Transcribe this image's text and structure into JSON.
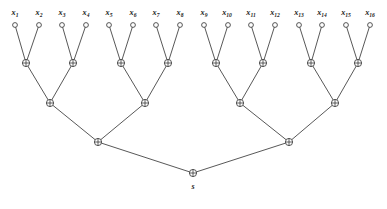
{
  "diagram": {
    "name": "xor-binary-tree",
    "background_color": "#ffffff",
    "line_color": "#3a3a3a",
    "text_color": "#1c1c1c",
    "operator_symbol": "xor-plus-circle",
    "root_label": "s",
    "levels": 5,
    "leaf_count": 16
  },
  "leaves": [
    {
      "id": "x1",
      "base": "x",
      "sub": "1",
      "cx": 15,
      "cy": 25,
      "label_x": 15,
      "label_y": 15
    },
    {
      "id": "x2",
      "base": "x",
      "sub": "2",
      "cx": 39,
      "cy": 25,
      "label_x": 39,
      "label_y": 15
    },
    {
      "id": "x3",
      "base": "x",
      "sub": "3",
      "cx": 62,
      "cy": 25,
      "label_x": 62,
      "label_y": 15
    },
    {
      "id": "x4",
      "base": "x",
      "sub": "4",
      "cx": 86,
      "cy": 25,
      "label_x": 86,
      "label_y": 15
    },
    {
      "id": "x5",
      "base": "x",
      "sub": "5",
      "cx": 109,
      "cy": 25,
      "label_x": 109,
      "label_y": 15
    },
    {
      "id": "x6",
      "base": "x",
      "sub": "6",
      "cx": 133,
      "cy": 25,
      "label_x": 133,
      "label_y": 15
    },
    {
      "id": "x7",
      "base": "x",
      "sub": "7",
      "cx": 156,
      "cy": 25,
      "label_x": 156,
      "label_y": 15
    },
    {
      "id": "x8",
      "base": "x",
      "sub": "8",
      "cx": 180,
      "cy": 25,
      "label_x": 180,
      "label_y": 15
    },
    {
      "id": "x9",
      "base": "x",
      "sub": "9",
      "cx": 204,
      "cy": 25,
      "label_x": 204,
      "label_y": 15
    },
    {
      "id": "x10",
      "base": "x",
      "sub": "10",
      "cx": 228,
      "cy": 25,
      "label_x": 227,
      "label_y": 15
    },
    {
      "id": "x11",
      "base": "x",
      "sub": "11",
      "cx": 251,
      "cy": 25,
      "label_x": 251,
      "label_y": 15
    },
    {
      "id": "x12",
      "base": "x",
      "sub": "12",
      "cx": 275,
      "cy": 25,
      "label_x": 275,
      "label_y": 15
    },
    {
      "id": "x13",
      "base": "x",
      "sub": "13",
      "cx": 299,
      "cy": 25,
      "label_x": 299,
      "label_y": 15
    },
    {
      "id": "x14",
      "base": "x",
      "sub": "14",
      "cx": 322,
      "cy": 25,
      "label_x": 322,
      "label_y": 15
    },
    {
      "id": "x15",
      "base": "x",
      "sub": "15",
      "cx": 346,
      "cy": 25,
      "label_x": 346,
      "label_y": 15
    },
    {
      "id": "x16",
      "base": "x",
      "sub": "16",
      "cx": 370,
      "cy": 25,
      "label_x": 370,
      "label_y": 15
    }
  ],
  "xor_nodes": [
    {
      "id": "g1",
      "level": 1,
      "cx": 26,
      "cy": 63
    },
    {
      "id": "g2",
      "level": 1,
      "cx": 73,
      "cy": 63
    },
    {
      "id": "g3",
      "level": 1,
      "cx": 121,
      "cy": 63
    },
    {
      "id": "g4",
      "level": 1,
      "cx": 168,
      "cy": 63
    },
    {
      "id": "g5",
      "level": 1,
      "cx": 216,
      "cy": 63
    },
    {
      "id": "g6",
      "level": 1,
      "cx": 263,
      "cy": 63
    },
    {
      "id": "g7",
      "level": 1,
      "cx": 311,
      "cy": 63
    },
    {
      "id": "g8",
      "level": 1,
      "cx": 358,
      "cy": 63
    },
    {
      "id": "h1",
      "level": 2,
      "cx": 50,
      "cy": 103
    },
    {
      "id": "h2",
      "level": 2,
      "cx": 145,
      "cy": 103
    },
    {
      "id": "h3",
      "level": 2,
      "cx": 240,
      "cy": 103
    },
    {
      "id": "h4",
      "level": 2,
      "cx": 335,
      "cy": 103
    },
    {
      "id": "k1",
      "level": 3,
      "cx": 98,
      "cy": 142
    },
    {
      "id": "k2",
      "level": 3,
      "cx": 289,
      "cy": 142
    },
    {
      "id": "root",
      "level": 4,
      "cx": 193,
      "cy": 173
    }
  ],
  "edges": [
    {
      "from": "x1",
      "to": "g1"
    },
    {
      "from": "x2",
      "to": "g1"
    },
    {
      "from": "x3",
      "to": "g2"
    },
    {
      "from": "x4",
      "to": "g2"
    },
    {
      "from": "x5",
      "to": "g3"
    },
    {
      "from": "x6",
      "to": "g3"
    },
    {
      "from": "x7",
      "to": "g4"
    },
    {
      "from": "x8",
      "to": "g4"
    },
    {
      "from": "x9",
      "to": "g5"
    },
    {
      "from": "x10",
      "to": "g5"
    },
    {
      "from": "x11",
      "to": "g6"
    },
    {
      "from": "x12",
      "to": "g6"
    },
    {
      "from": "x13",
      "to": "g7"
    },
    {
      "from": "x14",
      "to": "g7"
    },
    {
      "from": "x15",
      "to": "g8"
    },
    {
      "from": "x16",
      "to": "g8"
    },
    {
      "from": "g1",
      "to": "h1"
    },
    {
      "from": "g2",
      "to": "h1"
    },
    {
      "from": "g3",
      "to": "h2"
    },
    {
      "from": "g4",
      "to": "h2"
    },
    {
      "from": "g5",
      "to": "h3"
    },
    {
      "from": "g6",
      "to": "h3"
    },
    {
      "from": "g7",
      "to": "h4"
    },
    {
      "from": "g8",
      "to": "h4"
    },
    {
      "from": "h1",
      "to": "k1"
    },
    {
      "from": "h2",
      "to": "k1"
    },
    {
      "from": "h3",
      "to": "k2"
    },
    {
      "from": "h4",
      "to": "k2"
    },
    {
      "from": "k1",
      "to": "root"
    },
    {
      "from": "k2",
      "to": "root"
    }
  ],
  "root_output": {
    "label": "s",
    "x": 193,
    "y": 189
  },
  "geometry": {
    "leaf_radius": 2.4,
    "xor_radius": 3.6,
    "canvas_width": 387,
    "canvas_height": 209
  }
}
